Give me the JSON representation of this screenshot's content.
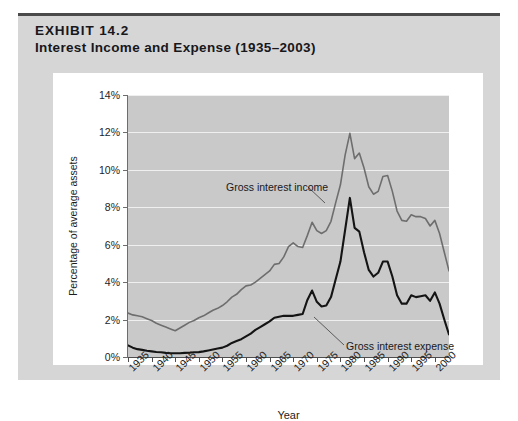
{
  "exhibit": {
    "number": "EXHIBIT 14.2",
    "title": "Interest Income and Expense (1935–2003)"
  },
  "colors": {
    "card_background": "#d6d6d6",
    "panel_background": "#ffffff",
    "plot_background": "#c9c9c9",
    "gridline": "#efefef",
    "income_line": "#6e6e6e",
    "expense_line": "#141414",
    "axis": "#4e4e4e",
    "top_rule": "#4a4a4a"
  },
  "chart_data": {
    "type": "line",
    "title": "Interest Income and Expense (1935–2003)",
    "xlabel": "Year",
    "ylabel": "Percentage of average assets",
    "xlim": [
      1935,
      2003
    ],
    "ylim": [
      0,
      14
    ],
    "grid": true,
    "legend_position": "inline-annotations",
    "y_ticks": [
      0,
      2,
      4,
      6,
      8,
      10,
      12,
      14
    ],
    "y_tick_labels": [
      "0%",
      "2%",
      "4%",
      "6%",
      "8%",
      "10%",
      "12%",
      "14%"
    ],
    "x_ticks": [
      1935,
      1940,
      1945,
      1950,
      1955,
      1960,
      1965,
      1970,
      1975,
      1980,
      1985,
      1990,
      1995,
      2000
    ],
    "x_tick_labels": [
      "1935",
      "1940",
      "1945",
      "1950",
      "1955",
      "1960",
      "1965",
      "1970",
      "1975",
      "1980",
      "1985",
      "1990",
      "1995",
      "2000"
    ],
    "x": [
      1935,
      1936,
      1937,
      1938,
      1939,
      1940,
      1941,
      1942,
      1943,
      1944,
      1945,
      1946,
      1947,
      1948,
      1949,
      1950,
      1951,
      1952,
      1953,
      1954,
      1955,
      1956,
      1957,
      1958,
      1959,
      1960,
      1961,
      1962,
      1963,
      1964,
      1965,
      1966,
      1967,
      1968,
      1969,
      1970,
      1971,
      1972,
      1973,
      1974,
      1975,
      1976,
      1977,
      1978,
      1979,
      1980,
      1981,
      1982,
      1983,
      1984,
      1985,
      1986,
      1987,
      1988,
      1989,
      1990,
      1991,
      1992,
      1993,
      1994,
      1995,
      1996,
      1997,
      1998,
      1999,
      2000,
      2001,
      2002,
      2003
    ],
    "series": [
      {
        "name": "Gross interest income",
        "color": "#6e6e6e",
        "annotation": "Gross interest income",
        "values": [
          2.35,
          2.25,
          2.2,
          2.15,
          2.05,
          1.95,
          1.8,
          1.7,
          1.6,
          1.5,
          1.4,
          1.55,
          1.7,
          1.85,
          1.95,
          2.1,
          2.2,
          2.35,
          2.5,
          2.6,
          2.75,
          2.95,
          3.2,
          3.35,
          3.6,
          3.8,
          3.85,
          4.0,
          4.2,
          4.4,
          4.6,
          4.95,
          5.0,
          5.35,
          5.9,
          6.1,
          5.9,
          5.85,
          6.5,
          7.2,
          6.75,
          6.6,
          6.75,
          7.25,
          8.25,
          9.2,
          10.8,
          11.95,
          10.6,
          10.9,
          10.1,
          9.1,
          8.7,
          8.85,
          9.65,
          9.7,
          8.85,
          7.8,
          7.3,
          7.25,
          7.6,
          7.5,
          7.5,
          7.4,
          7.0,
          7.3,
          6.6,
          5.6,
          4.6
        ]
      },
      {
        "name": "Gross interest expense",
        "color": "#141414",
        "annotation": "Gross interest expense",
        "values": [
          0.62,
          0.5,
          0.42,
          0.38,
          0.33,
          0.3,
          0.27,
          0.25,
          0.22,
          0.2,
          0.2,
          0.2,
          0.22,
          0.23,
          0.25,
          0.26,
          0.3,
          0.35,
          0.4,
          0.45,
          0.5,
          0.6,
          0.75,
          0.85,
          0.95,
          1.1,
          1.25,
          1.45,
          1.6,
          1.75,
          1.9,
          2.1,
          2.15,
          2.2,
          2.2,
          2.2,
          2.25,
          2.3,
          3.05,
          3.55,
          2.95,
          2.7,
          2.75,
          3.2,
          4.15,
          5.1,
          6.8,
          8.5,
          6.9,
          6.7,
          5.6,
          4.65,
          4.3,
          4.5,
          5.1,
          5.1,
          4.3,
          3.3,
          2.85,
          2.85,
          3.3,
          3.2,
          3.25,
          3.3,
          3.0,
          3.45,
          2.85,
          2.0,
          1.2
        ]
      }
    ]
  }
}
